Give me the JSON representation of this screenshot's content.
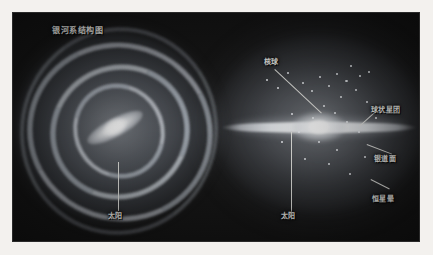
{
  "figure": {
    "kind": "astronomy-diagram",
    "title": "银河系结构图",
    "title_translation": "Structure Diagram of the Milky Way Galaxy",
    "background_color": "#f3f1ee",
    "plate_color": "#141414",
    "leader_line_color": "#e8e8e4",
    "label_color": "#f2f2ee"
  },
  "panels": [
    {
      "id": "face-on",
      "name": "face-on-spiral-view",
      "description": "Face-on view of the barred spiral galaxy showing spiral arms and central bar"
    },
    {
      "id": "edge-on",
      "name": "edge-on-view",
      "description": "Edge-on view of the galaxy showing the thin disk, central bulge and surrounding halo"
    }
  ],
  "labels": {
    "title": "银河系结构图",
    "sun_face": "太阳",
    "sun_edge": "太阳",
    "bulge": "核球",
    "globular_clusters": "球状星团",
    "galactic_plane": "银道面",
    "stellar_halo": "恒星晕"
  },
  "annotations": [
    {
      "key": "title",
      "text": "银河系结构图",
      "panel": "face-on",
      "has_leader": false
    },
    {
      "key": "sun_face",
      "text": "太阳",
      "panel": "face-on",
      "has_leader": true
    },
    {
      "key": "bulge",
      "text": "核球",
      "panel": "edge-on",
      "has_leader": true
    },
    {
      "key": "globular_clusters",
      "text": "球状星团",
      "panel": "edge-on",
      "has_leader": true
    },
    {
      "key": "galactic_plane",
      "text": "银道面",
      "panel": "edge-on",
      "has_leader": true
    },
    {
      "key": "stellar_halo",
      "text": "恒星晕",
      "panel": "edge-on",
      "has_leader": true
    },
    {
      "key": "sun_edge",
      "text": "太阳",
      "panel": "edge-on",
      "has_leader": true
    }
  ]
}
